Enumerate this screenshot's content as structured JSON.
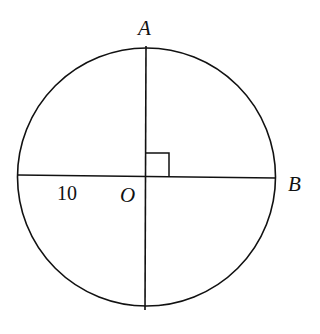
{
  "diagram": {
    "type": "circle-geometry",
    "circle": {
      "center_label": "O",
      "radius_label": "10"
    },
    "points": [
      {
        "id": "A",
        "label": "A",
        "position": "top of circle"
      },
      {
        "id": "B",
        "label": "B",
        "position": "right of circle"
      },
      {
        "id": "O",
        "label": "O",
        "position": "center"
      }
    ],
    "annotations": {
      "right_angle": "angle AOB = 90°",
      "radius_value": "10"
    },
    "colors": {
      "stroke": "#111111",
      "background": "#ffffff"
    }
  }
}
